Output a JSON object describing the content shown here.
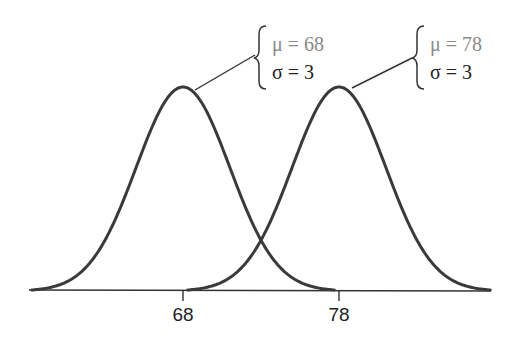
{
  "chart_data": {
    "type": "line",
    "title": "",
    "xlabel": "",
    "ylabel": "",
    "grid": false,
    "legend": "none",
    "x_ticks": [
      68,
      78
    ],
    "x_tick_labels": [
      "68",
      "78"
    ],
    "xlim": [
      58,
      88
    ],
    "series": [
      {
        "name": "Normal(μ=68, σ=3)",
        "distribution": "normal",
        "mean": 68,
        "sd": 3
      },
      {
        "name": "Normal(μ=78, σ=3)",
        "distribution": "normal",
        "mean": 78,
        "sd": 3
      }
    ],
    "annotations": [
      {
        "target_series": 0,
        "mu_label": "μ = 68",
        "sigma_label": "σ = 3"
      },
      {
        "target_series": 1,
        "mu_label": "μ = 78",
        "sigma_label": "σ = 3"
      }
    ]
  },
  "colors": {
    "curve": "#3a3a3a",
    "mu_text": "#8a8a8a",
    "sigma_text": "#222222"
  }
}
